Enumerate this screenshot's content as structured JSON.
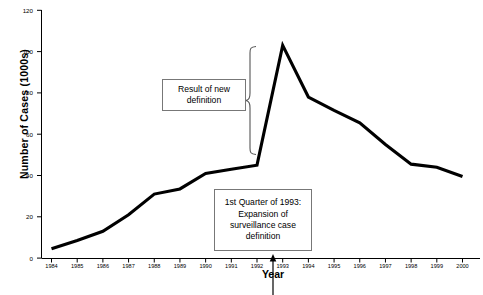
{
  "chart_data": {
    "type": "line",
    "title": "",
    "xlabel": "Year",
    "ylabel": "Number of Cases (1000s)",
    "xlim": [
      1984,
      2000
    ],
    "ylim": [
      0,
      120
    ],
    "ytick_values": [
      0,
      20,
      40,
      60,
      80,
      100,
      120
    ],
    "ytick_labels": [
      "0",
      "20",
      "40",
      "60",
      "80",
      "100",
      "120"
    ],
    "xtick_labels": [
      "1984",
      "1985",
      "1986",
      "1987",
      "1988",
      "1989",
      "1990",
      "1991",
      "1992",
      "1993",
      "1994",
      "1995",
      "1996",
      "1997",
      "1998",
      "1999",
      "2000"
    ],
    "grid": false,
    "legend": null,
    "series": [
      {
        "name": "AIDS cases reported",
        "color": "#000000",
        "x": [
          1984,
          1985,
          1986,
          1987,
          1988,
          1989,
          1990,
          1991,
          1992,
          1993,
          1994,
          1995,
          1996,
          1997,
          1998,
          1999,
          2000
        ],
        "values": [
          4.5,
          8.5,
          13.0,
          21.0,
          31.0,
          33.5,
          41.0,
          43.0,
          45.0,
          103.0,
          78.0,
          71.5,
          65.5,
          55.0,
          45.5,
          44.0,
          39.5
        ]
      }
    ],
    "annotations": [
      {
        "name": "result-of-new-definition",
        "text": "Result of new definition",
        "lines": [
          "Result of new",
          "definition"
        ],
        "boxed": true
      },
      {
        "name": "surveillance-case-definition",
        "text": "1st Quarter of 1993: Expansion of surveillance case definition",
        "lines": [
          "1st Quarter of  1993:",
          "Expansion of",
          "surveillance case",
          "definition"
        ],
        "boxed": true
      },
      {
        "name": "brace-marker",
        "text": "",
        "shape": "curly-brace",
        "spans_y": [
          45,
          103
        ]
      },
      {
        "name": "axis-arrow-1993",
        "text": "",
        "shape": "up-arrow",
        "points_at_x": 1992.75
      }
    ],
    "colors": {
      "line": "#000000",
      "axis": "#000000",
      "callout_border": "#777777",
      "brace": "#555555",
      "background": "#ffffff"
    }
  }
}
